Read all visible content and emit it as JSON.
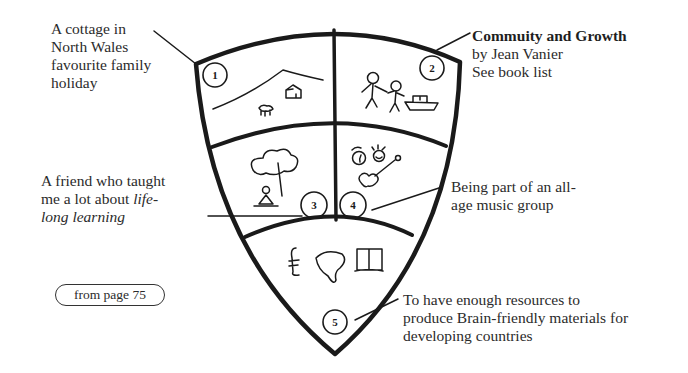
{
  "diagram": {
    "type": "shield-of-life-influences",
    "sections": [
      {
        "number": "1",
        "icon": "mountain-cottage-sheep",
        "caption": [
          "A cottage in",
          "North Wales",
          "favourite family",
          "holiday"
        ]
      },
      {
        "number": "2",
        "icon": "two-people-boat",
        "caption_title": "Commuity and Growth",
        "caption": [
          "by Jean Vanier",
          "See book list"
        ]
      },
      {
        "number": "3",
        "icon": "tree-meditating-figure",
        "caption": [
          "A friend who taught",
          "me a lot about "
        ],
        "caption_italic_1": "life-",
        "caption_italic_2": "long learning"
      },
      {
        "number": "4",
        "icon": "faces-guitar",
        "caption": [
          "Being part of an all-",
          "age music group"
        ]
      },
      {
        "number": "5",
        "icon": "pound-map-book",
        "caption": [
          "To have enough resources to",
          "produce Brain-friendly materials for",
          "developing countries"
        ]
      }
    ],
    "page_reference": "from page 75",
    "colors": {
      "ink": "#1a1a1a",
      "text": "#2b2b2b",
      "background": "#ffffff"
    }
  }
}
